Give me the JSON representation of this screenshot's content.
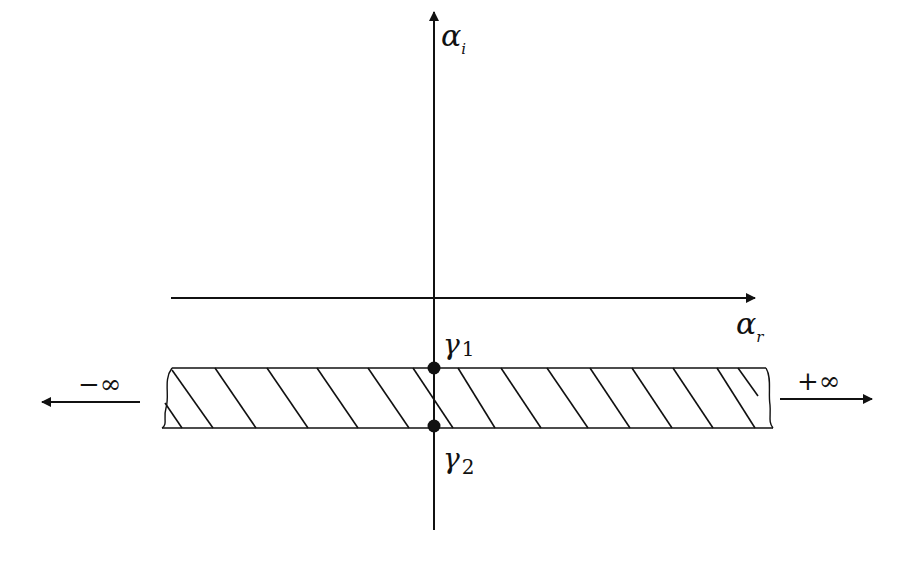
{
  "diagram": {
    "axes": {
      "vertical": {
        "label": "α",
        "subscript": "i"
      },
      "horizontal": {
        "label": "α",
        "subscript": "r"
      }
    },
    "points": [
      {
        "id": "gamma1",
        "label": "γ",
        "subscript": "1"
      },
      {
        "id": "gamma2",
        "label": "γ",
        "subscript": "2"
      }
    ],
    "strip": {
      "description": "hatched horizontal strip",
      "hatch_lines": 13
    },
    "arrows": {
      "left": {
        "label": "−∞"
      },
      "right": {
        "label": "+∞"
      }
    },
    "colors": {
      "stroke": "#111111",
      "background": "#ffffff"
    }
  }
}
